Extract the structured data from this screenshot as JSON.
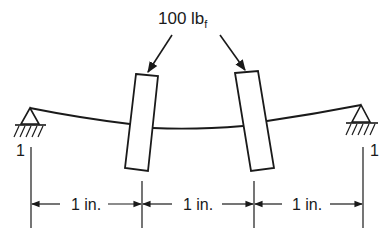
{
  "diagram": {
    "type": "simply-supported shaft with two inclined loads",
    "load_label": "100 lb",
    "load_subscript": "f",
    "support_left_label": "1",
    "support_right_label": "1",
    "dimensions": [
      {
        "label": "1 in."
      },
      {
        "label": "1 in."
      },
      {
        "label": "1 in."
      }
    ],
    "colors": {
      "ink": "#1a1a1a",
      "background": "#ffffff"
    }
  }
}
